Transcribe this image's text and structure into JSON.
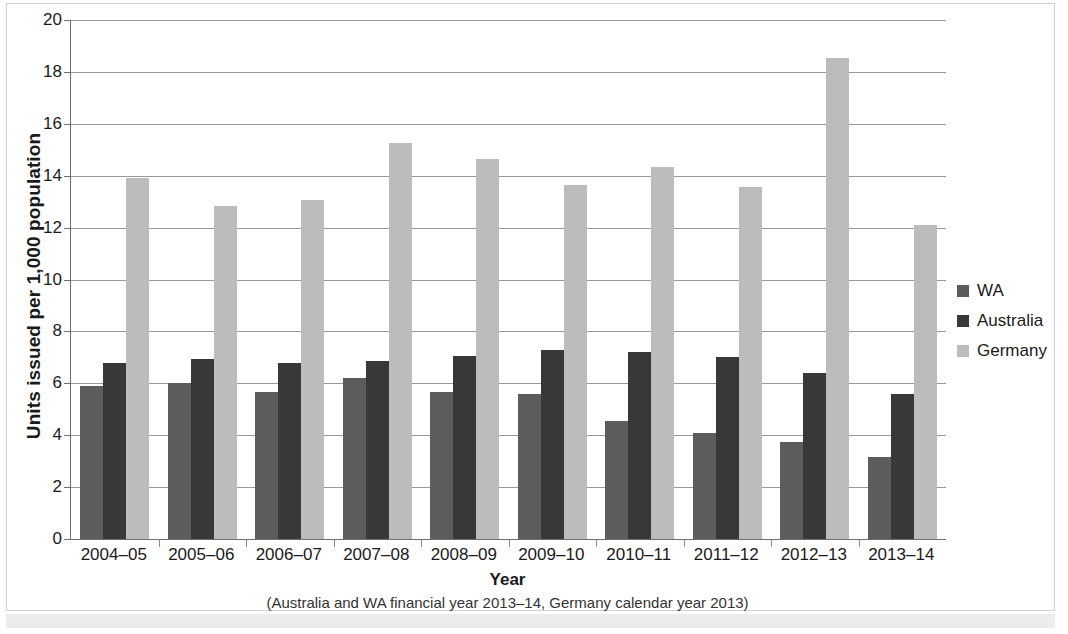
{
  "chart_data": {
    "type": "bar",
    "title": "",
    "xlabel": "Year",
    "xlabel_note": "(Australia and WA financial year 2013–14, Germany calendar year 2013)",
    "ylabel": "Units issued per 1,000 population",
    "ylim": [
      0,
      20
    ],
    "ytick_step": 2,
    "yticks": [
      20,
      18,
      16,
      14,
      12,
      10,
      8,
      6,
      4,
      2,
      0
    ],
    "grid": true,
    "legend_position": "right",
    "categories": [
      "2004–05",
      "2005–06",
      "2006–07",
      "2007–08",
      "2008–09",
      "2009–10",
      "2010–11",
      "2011–12",
      "2012–13",
      "2013–14"
    ],
    "series": [
      {
        "name": "WA",
        "color": "#5c5c5c",
        "values": [
          5.9,
          6.0,
          5.65,
          6.2,
          5.65,
          5.6,
          4.55,
          4.1,
          3.75,
          3.15
        ]
      },
      {
        "name": "Australia",
        "color": "#383838",
        "values": [
          6.8,
          6.95,
          6.8,
          6.85,
          7.05,
          7.3,
          7.2,
          7.0,
          6.4,
          5.6
        ]
      },
      {
        "name": "Germany",
        "color": "#bcbcbc",
        "values": [
          13.9,
          12.85,
          13.05,
          15.25,
          14.65,
          13.65,
          14.35,
          13.55,
          18.55,
          12.1
        ]
      }
    ]
  },
  "legend": {
    "items": [
      {
        "label": "WA",
        "key": "wa"
      },
      {
        "label": "Australia",
        "key": "australia"
      },
      {
        "label": "Germany",
        "key": "germany"
      }
    ]
  }
}
